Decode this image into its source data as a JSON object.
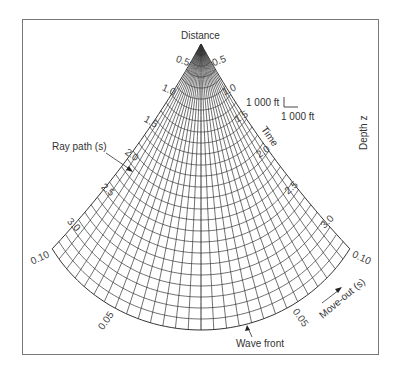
{
  "title": "Distance",
  "axes": {
    "distance_label": "Distance",
    "depth_label": "Depth z",
    "time_label": "Time",
    "moveout_label": "Move-out (s)"
  },
  "annotations": {
    "ray_path": "Ray path (s)",
    "wave_front": "Wave front"
  },
  "scale_bar": {
    "vertical": "1 000 ft",
    "horizontal": "1 000 ft"
  },
  "time_ticks_left": [
    "0.5",
    "1.0",
    "1.5",
    "2.0",
    "2.5",
    "3.0"
  ],
  "time_ticks_right": [
    "0.5",
    "1.0",
    "1.5",
    "2.0",
    "2.5",
    "3.0"
  ],
  "moveout_ticks_left": [
    "0.10",
    "0.05"
  ],
  "moveout_ticks_right": [
    "0.10",
    "0.05"
  ],
  "grid": {
    "apex": [
      201,
      44
    ],
    "radius_center": 286,
    "edge_shrink": 0.115,
    "half_angle_deg": 36,
    "rays": 29,
    "wavefronts": 26,
    "line_color": "#333333"
  }
}
